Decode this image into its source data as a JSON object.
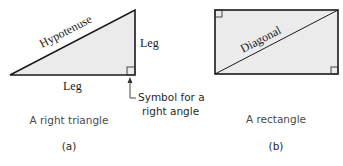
{
  "figure": {
    "panel_a": {
      "shape": "right-triangle",
      "labels": {
        "hypotenuse": "Hypotenuse",
        "leg_bottom": "Leg",
        "leg_right": "Leg"
      },
      "annotation_line1": "Symbol for a",
      "annotation_line2": "right angle",
      "caption": "A right triangle",
      "tag": "(a)"
    },
    "panel_b": {
      "shape": "rectangle",
      "labels": {
        "diagonal": "Diagonal"
      },
      "caption": "A rectangle",
      "tag": "(b)"
    },
    "colors": {
      "fill": "#ebebeb",
      "stroke": "#1a1a1a",
      "caption_text": "#4a4a4a"
    }
  }
}
